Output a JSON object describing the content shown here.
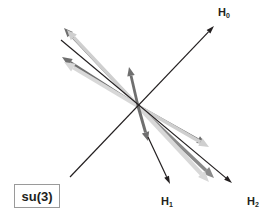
{
  "figure": {
    "kind": "su(3) root diagram",
    "background_color": "#ffffff"
  },
  "tag": {
    "label": "su(3)",
    "border_color": "#9a9a9a",
    "text_color": "#231f20"
  },
  "axes": [
    {
      "name": "H0",
      "label": "H",
      "subscript": "0",
      "color": "#231f20",
      "from": [
        70,
        177
      ],
      "to": [
        214,
        26
      ],
      "label_pos": [
        218,
        7
      ]
    },
    {
      "name": "H1",
      "label": "H",
      "subscript": "1",
      "color": "#231f20",
      "from": [
        148,
        137
      ],
      "to": [
        170,
        184
      ],
      "label_pos": [
        161,
        196
      ]
    },
    {
      "name": "H2",
      "label": "H",
      "subscript": "2",
      "color": "#231f20",
      "from": [
        61,
        40
      ],
      "to": [
        232,
        183
      ],
      "label_pos": [
        247,
        196
      ]
    }
  ],
  "roots": [
    {
      "name": "root-up-left-dark",
      "color": "#6e6e6e",
      "width": 2.6,
      "from": [
        138,
        106
      ],
      "to": [
        64,
        28
      ],
      "head": 9
    },
    {
      "name": "root-up-left-mid",
      "color": "#6f6f6f",
      "width": 3.0,
      "from": [
        138,
        106
      ],
      "to": [
        62,
        57
      ],
      "head": 10
    },
    {
      "name": "root-up-left-light",
      "color": "#cfcfcf",
      "width": 3.4,
      "from": [
        138,
        106
      ],
      "to": [
        67,
        30
      ],
      "head": 10
    },
    {
      "name": "root-up-left-pale",
      "color": "#d8d8d8",
      "width": 4.0,
      "from": [
        138,
        106
      ],
      "to": [
        64,
        62
      ],
      "head": 11
    },
    {
      "name": "root-down-right-dark",
      "color": "#6e6e6e",
      "width": 2.6,
      "from": [
        138,
        106
      ],
      "to": [
        206,
        144
      ],
      "head": 9
    },
    {
      "name": "root-down-right-mid",
      "color": "#8a8a8a",
      "width": 3.4,
      "from": [
        138,
        106
      ],
      "to": [
        214,
        178
      ],
      "head": 11
    },
    {
      "name": "root-down-right-light",
      "color": "#cfcfcf",
      "width": 3.6,
      "from": [
        138,
        106
      ],
      "to": [
        209,
        147
      ],
      "head": 10
    },
    {
      "name": "root-down-right-pale",
      "color": "#d8d8d8",
      "width": 4.2,
      "from": [
        138,
        106
      ],
      "to": [
        209,
        182
      ],
      "head": 11
    },
    {
      "name": "root-up-vertical",
      "color": "#6f6f6f",
      "width": 2.8,
      "from": [
        138,
        106
      ],
      "to": [
        129,
        67
      ],
      "head": 9
    },
    {
      "name": "root-down-vertical",
      "color": "#6f6f6f",
      "width": 3.0,
      "from": [
        138,
        106
      ],
      "to": [
        148,
        141
      ],
      "head": 9
    }
  ]
}
